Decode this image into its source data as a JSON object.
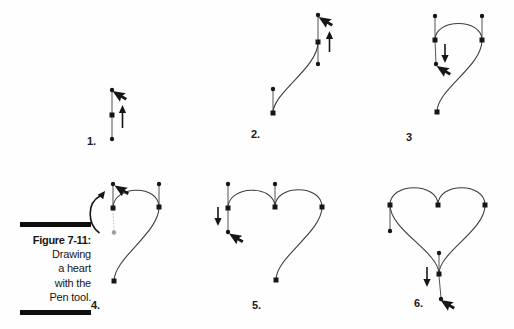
{
  "figure": {
    "caption": {
      "title": "Figure 7-11:",
      "lines": [
        "Drawing",
        "a heart",
        "with the",
        "Pen tool."
      ]
    },
    "steps": [
      {
        "label": "1."
      },
      {
        "label": "2."
      },
      {
        "label": "3"
      },
      {
        "label": "4."
      },
      {
        "label": "5."
      },
      {
        "label": "6."
      }
    ],
    "icons": {
      "cursor": "arrow-cursor-icon",
      "drag_up": "drag-up-arrow-icon",
      "drag_down": "drag-down-arrow-icon",
      "rotate": "rotate-direction-arrow-icon"
    },
    "colors": {
      "ink": "#161616",
      "curve": "#3e3e3e",
      "ghost": "#9e9e9e",
      "background": "#ffffff"
    }
  }
}
